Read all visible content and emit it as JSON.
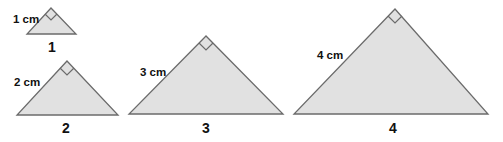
{
  "diagram": {
    "title": "",
    "colors": {
      "fill": "#e1e1e1",
      "stroke": "#6b6b6b",
      "text": "#111111"
    },
    "triangles": [
      {
        "id": 1,
        "number_label": "1",
        "side_label": "1 cm",
        "right_angle_marker": true,
        "apex": [
          51,
          8
        ],
        "base_left": [
          27,
          34
        ],
        "base_right": [
          76,
          34
        ],
        "side_label_pos": [
          13,
          23
        ],
        "number_label_pos": [
          52,
          52
        ]
      },
      {
        "id": 2,
        "number_label": "2",
        "side_label": "2 cm",
        "right_angle_marker": true,
        "apex": [
          67,
          61
        ],
        "base_left": [
          17,
          115
        ],
        "base_right": [
          118,
          115
        ],
        "side_label_pos": [
          14,
          86
        ],
        "number_label_pos": [
          66,
          133
        ]
      },
      {
        "id": 3,
        "number_label": "3",
        "side_label": "3 cm",
        "right_angle_marker": true,
        "apex": [
          206,
          36
        ],
        "base_left": [
          129,
          114
        ],
        "base_right": [
          283,
          114
        ],
        "side_label_pos": [
          140,
          76
        ],
        "number_label_pos": [
          206,
          133
        ]
      },
      {
        "id": 4,
        "number_label": "4",
        "side_label": "4 cm",
        "right_angle_marker": true,
        "apex": [
          395,
          9
        ],
        "base_left": [
          294,
          114
        ],
        "base_right": [
          488,
          114
        ],
        "side_label_pos": [
          317,
          59
        ],
        "number_label_pos": [
          393,
          133
        ]
      }
    ]
  }
}
